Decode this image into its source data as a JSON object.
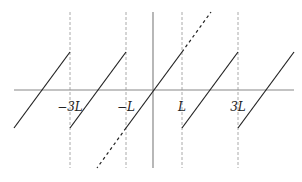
{
  "diagram": {
    "colors": {
      "axis": "#888888",
      "curve": "#222222",
      "guide": "#aaaaaa",
      "background": "#ffffff"
    },
    "axis": {
      "x_axis": {
        "y": 90,
        "x_start": 14,
        "x_end": 294
      },
      "y_axis": {
        "x": 153,
        "y_start": 12,
        "y_end": 168
      }
    },
    "period_px": 56,
    "tick_labels": [
      {
        "text": "−3L",
        "x": 70,
        "y": 108
      },
      {
        "text": "−L",
        "x": 126,
        "y": 108
      },
      {
        "text": "L",
        "x": 182,
        "y": 108
      },
      {
        "text": "3L",
        "x": 238,
        "y": 108
      }
    ],
    "guide_lines_x": [
      70,
      126,
      182,
      238
    ],
    "segments": [
      {
        "x1": 14,
        "y1": 128,
        "x2": 70,
        "y2": 52
      },
      {
        "x1": 70,
        "y1": 128,
        "x2": 126,
        "y2": 52
      },
      {
        "x1": 126,
        "y1": 128,
        "x2": 182,
        "y2": 52
      },
      {
        "x1": 182,
        "y1": 128,
        "x2": 238,
        "y2": 52
      },
      {
        "x1": 238,
        "y1": 128,
        "x2": 294,
        "y2": 52
      }
    ],
    "dashed_extensions": [
      {
        "x1": 182,
        "y1": 52,
        "x2": 211,
        "y2": 12
      },
      {
        "x1": 126,
        "y1": 128,
        "x2": 97,
        "y2": 168
      }
    ]
  }
}
